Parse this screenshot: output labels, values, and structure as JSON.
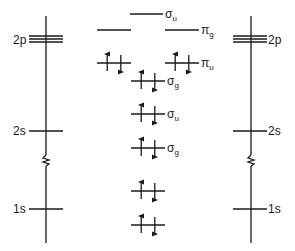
{
  "diagram": {
    "title": "",
    "atoms": {
      "left": {
        "levels": [
          {
            "label": "2p",
            "lines": 3
          },
          {
            "label": "2s",
            "lines": 1
          },
          {
            "label": "1s",
            "lines": 1
          }
        ]
      },
      "right": {
        "levels": [
          {
            "label": "2p",
            "lines": 3
          },
          {
            "label": "2s",
            "lines": 1
          },
          {
            "label": "1s",
            "lines": 1
          }
        ]
      }
    },
    "axis_break": "zigzag between 2s and 1s",
    "molecular_orbitals": [
      {
        "id": "sigma-u-star-2p",
        "symbol": "σ",
        "subscript": "u",
        "degenerate": 1,
        "electrons": 0
      },
      {
        "id": "pi-g-star-2p",
        "symbol": "π",
        "subscript": "g",
        "degenerate": 2,
        "electrons": 0
      },
      {
        "id": "pi-u-2p",
        "symbol": "π",
        "subscript": "u",
        "degenerate": 2,
        "electrons": 4
      },
      {
        "id": "sigma-g-2p",
        "symbol": "σ",
        "subscript": "g",
        "degenerate": 1,
        "electrons": 2
      },
      {
        "id": "sigma-u-star-2s",
        "symbol": "σ",
        "subscript": "u",
        "degenerate": 1,
        "electrons": 2
      },
      {
        "id": "sigma-g-2s",
        "symbol": "σ",
        "subscript": "g",
        "degenerate": 1,
        "electrons": 2
      },
      {
        "id": "sigma-u-star-1s",
        "symbol": "",
        "subscript": "",
        "degenerate": 1,
        "electrons": 2
      },
      {
        "id": "sigma-g-1s",
        "symbol": "",
        "subscript": "",
        "degenerate": 1,
        "electrons": 2
      }
    ]
  }
}
